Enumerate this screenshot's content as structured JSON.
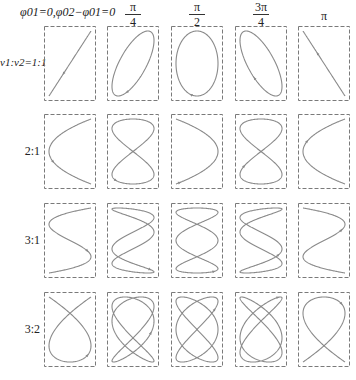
{
  "header": {
    "first_label_prefix": "φ",
    "first_label": "φ01=0,φ02−φ01=0",
    "columns": [
      {
        "phase_label": "0",
        "num": "",
        "den": "",
        "single": ""
      },
      {
        "phase_label": "π/4",
        "num": "π",
        "den": "4",
        "single": ""
      },
      {
        "phase_label": "π/2",
        "num": "π",
        "den": "2",
        "single": ""
      },
      {
        "phase_label": "3π/4",
        "num": "3π",
        "den": "4",
        "single": ""
      },
      {
        "phase_label": "π",
        "num": "",
        "den": "",
        "single": "π"
      }
    ]
  },
  "rows": [
    {
      "label": "ν1:ν2=1:1",
      "ratio": "1:1",
      "fy": 1,
      "fx": 1
    },
    {
      "label": "2:1",
      "ratio": "2:1",
      "fy": 2,
      "fx": 1
    },
    {
      "label": "3:1",
      "ratio": "3:1",
      "fy": 3,
      "fx": 1
    },
    {
      "label": "3:2",
      "ratio": "3:2",
      "fy": 3,
      "fx": 2
    }
  ],
  "phases": [
    0,
    0.7853981634,
    1.5707963268,
    2.3561944902,
    3.1415926536
  ],
  "colors": {
    "curve": "#8a8a8a",
    "frame": "#7a7a7a",
    "text": "#222222"
  }
}
